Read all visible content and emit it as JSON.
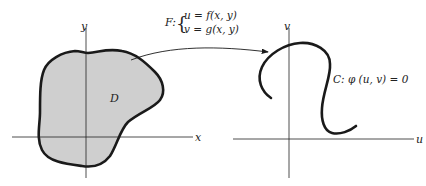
{
  "diagram": {
    "left_plane": {
      "x_axis_label": "x",
      "y_axis_label": "y",
      "region_label": "D",
      "region_fill": "#cfcfcf"
    },
    "mapping": {
      "name": "F:",
      "brace": "{",
      "line1": "u = f(x, y)",
      "line2": "v = g(x, y)"
    },
    "right_plane": {
      "u_axis_label": "u",
      "v_axis_label": "v",
      "curve_label": "C:  φ (u, v) = 0"
    },
    "colors": {
      "stroke": "#1a1a1a",
      "text": "#222222",
      "background": "#ffffff"
    }
  }
}
